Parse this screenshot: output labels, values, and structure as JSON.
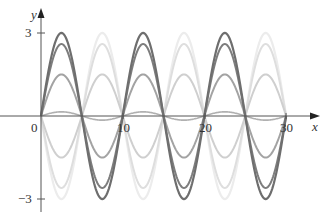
{
  "chart_data": {
    "type": "line",
    "title": "",
    "xlabel": "x",
    "ylabel": "y",
    "xlim": [
      0,
      31
    ],
    "ylim": [
      -3.2,
      3.3
    ],
    "x_ticks": [
      0,
      10,
      20,
      30
    ],
    "x_tick_labels": [
      "0",
      "10",
      "20",
      "30"
    ],
    "y_ticks": [
      3,
      -3
    ],
    "y_tick_labels": [
      "3",
      "−3"
    ],
    "grid": false,
    "legend": null,
    "function": "y = A · sin(πx/5)",
    "period": 10,
    "series": [
      {
        "name": "A=3",
        "amplitude": 3,
        "color": "#6e6e6e",
        "width": 2.2
      },
      {
        "name": "A=2.6",
        "amplitude": 2.6,
        "color": "#7d7d7d",
        "width": 2
      },
      {
        "name": "A=1.5",
        "amplitude": 1.5,
        "color": "#a3a3a3",
        "width": 2
      },
      {
        "name": "A=0.15",
        "amplitude": 0.15,
        "color": "#b0b0b0",
        "width": 1.6
      },
      {
        "name": "A=-1.5",
        "amplitude": -1.5,
        "color": "#cfcfcf",
        "width": 2
      },
      {
        "name": "A=-2.6",
        "amplitude": -2.6,
        "color": "#dedede",
        "width": 2
      },
      {
        "name": "A=-3",
        "amplitude": -3,
        "color": "#ececec",
        "width": 2.2
      }
    ]
  },
  "axes": {
    "x_label": "x",
    "y_label": "y",
    "origin_label": "0",
    "axis_color": "#555555"
  },
  "layout": {
    "origin_px": [
      41,
      116
    ],
    "x_scale_px_per_unit": 8.17,
    "y_scale_px_per_unit": 27.7
  }
}
